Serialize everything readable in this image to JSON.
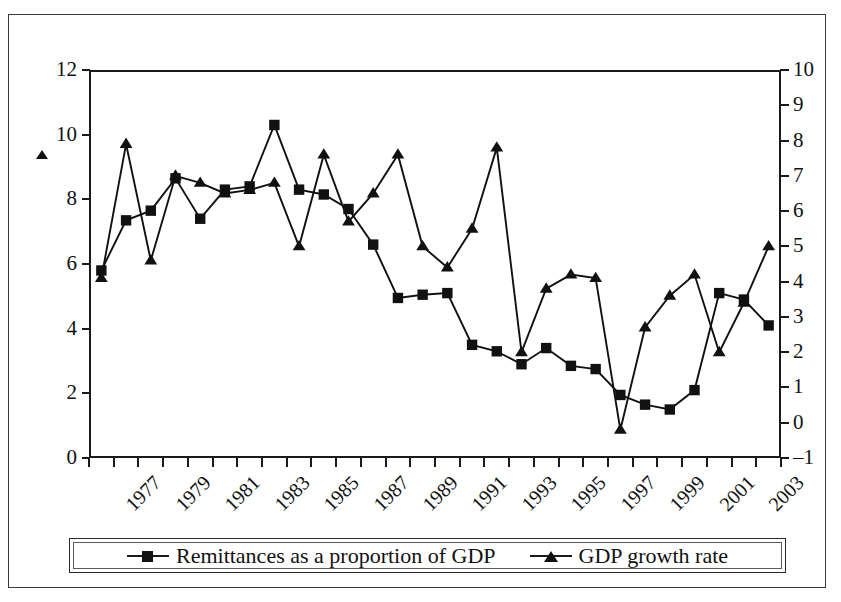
{
  "chart_data": {
    "type": "line",
    "title": "",
    "subtitle": "",
    "xlabel": "",
    "ylabel": "",
    "grid": false,
    "legend_position": "bottom",
    "x": [
      1977,
      1978,
      1979,
      1980,
      1981,
      1982,
      1983,
      1984,
      1985,
      1986,
      1987,
      1988,
      1989,
      1990,
      1991,
      1992,
      1993,
      1994,
      1995,
      1996,
      1997,
      1998,
      1999,
      2000,
      2001,
      2002,
      2003,
      2004
    ],
    "categories": [
      "1977",
      "1978",
      "1979",
      "1980",
      "1981",
      "1982",
      "1983",
      "1984",
      "1985",
      "1986",
      "1987",
      "1988",
      "1989",
      "1990",
      "1991",
      "1992",
      "1993",
      "1994",
      "1995",
      "1996",
      "1997",
      "1998",
      "1999",
      "2000",
      "2001",
      "2002",
      "2003",
      "2004"
    ],
    "x_tick_labels": [
      "1977",
      "",
      "1979",
      "",
      "1981",
      "",
      "1983",
      "",
      "1985",
      "",
      "1987",
      "",
      "1989",
      "",
      "1991",
      "",
      "1993",
      "",
      "1995",
      "",
      "1997",
      "",
      "1999",
      "",
      "2001",
      "",
      "2003",
      ""
    ],
    "left_axis": {
      "label": "Remittances as a proportion of GDP",
      "min": 0,
      "max": 12,
      "step": 2,
      "ticks": [
        "0",
        "2",
        "4",
        "6",
        "8",
        "10",
        "12"
      ]
    },
    "right_axis": {
      "label": "GDP growth rate",
      "min": -1,
      "max": 10,
      "step": 1,
      "ticks": [
        "–1",
        "0",
        "1",
        "2",
        "3",
        "4",
        "5",
        "6",
        "7",
        "8",
        "9",
        "10"
      ]
    },
    "series": [
      {
        "name": "Remittances as a proportion of GDP",
        "marker": "square",
        "axis": "left",
        "color": "#111111",
        "values": [
          5.8,
          7.35,
          7.65,
          8.65,
          7.4,
          8.3,
          8.4,
          10.3,
          8.3,
          8.15,
          7.7,
          6.6,
          4.95,
          5.05,
          5.1,
          3.5,
          3.3,
          2.9,
          3.4,
          2.85,
          2.75,
          1.95,
          1.65,
          1.5,
          2.1,
          5.1,
          4.9,
          4.1
        ]
      },
      {
        "name": "GDP growth rate",
        "marker": "triangle",
        "axis": "right",
        "color": "#111111",
        "values": [
          4.1,
          7.9,
          4.6,
          7.0,
          6.8,
          6.5,
          6.6,
          6.8,
          5.0,
          7.6,
          5.7,
          6.5,
          7.6,
          5.0,
          4.4,
          5.5,
          7.8,
          2.0,
          3.8,
          4.2,
          4.1,
          -0.2,
          2.7,
          3.6,
          4.2,
          2.0,
          3.4,
          5.0
        ]
      }
    ]
  },
  "legend": {
    "entries": [
      {
        "label": "Remittances as a proportion of GDP",
        "marker": "square"
      },
      {
        "label": "GDP growth rate",
        "marker": "triangle"
      }
    ]
  }
}
